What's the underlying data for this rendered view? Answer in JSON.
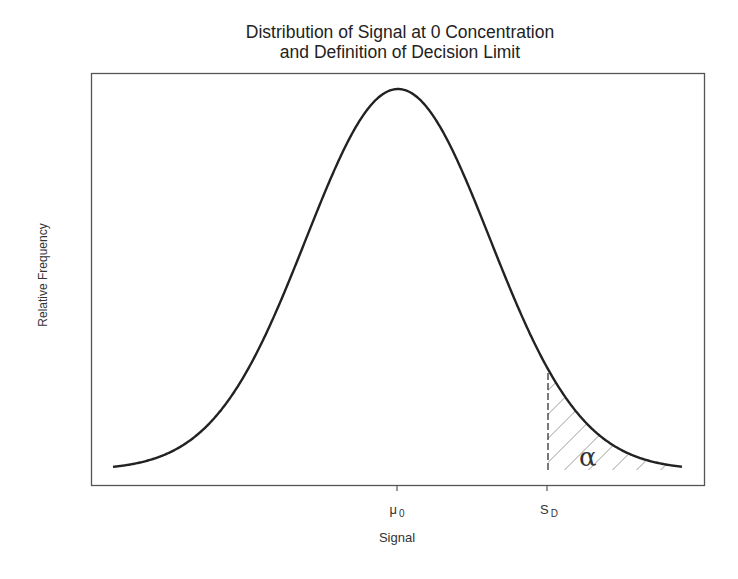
{
  "chart_data": {
    "type": "line",
    "title": "Distribution of Signal at 0 Concentration and Definition of Decision Limit",
    "title_lines": [
      "Distribution of Signal at 0 Concentration",
      "and Definition of Decision Limit"
    ],
    "xlabel": "Signal",
    "ylabel": "Relative Frequency",
    "x_ticks": [
      {
        "label": "μ",
        "subscript": "0",
        "position_px": 397
      },
      {
        "label": "S",
        "subscript": "D",
        "position_px": 547
      }
    ],
    "grid": false,
    "legend": null,
    "series": [
      {
        "name": "Distribution of signal at zero concentration",
        "shape": "normal (Gaussian) curve",
        "mean_label": "μ0",
        "peak_px": {
          "x": 398,
          "y": 89
        },
        "baseline_px": 470,
        "sigma_px": 92,
        "x_range_px": [
          113,
          682
        ]
      }
    ],
    "annotations": [
      {
        "type": "shaded_tail",
        "from_label": "SD",
        "side": "right",
        "pattern": "diagonal hatching",
        "label": "α"
      },
      {
        "type": "dashed_vertical_line",
        "at_label": "SD"
      }
    ]
  },
  "title": {
    "line1": "Distribution of Signal at 0 Concentration",
    "line2": "and Definition of Decision Limit"
  },
  "axes": {
    "xlabel": "Signal",
    "ylabel": "Relative Frequency",
    "ticks": [
      {
        "main": "μ",
        "sub": "0"
      },
      {
        "main": "S",
        "sub": "D"
      }
    ]
  },
  "annotation": {
    "alpha_symbol": "α"
  },
  "colors": {
    "curve": "#222222",
    "frame": "#555555",
    "hatch": "#666666"
  }
}
